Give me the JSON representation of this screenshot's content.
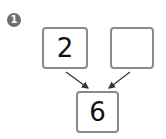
{
  "problem": {
    "number": "1",
    "top_left_value": "2",
    "top_right_value": "",
    "bottom_value": "6"
  },
  "colors": {
    "box_border": "#8a8a8a",
    "badge": "#6e6e6e",
    "arrow": "#333333"
  }
}
